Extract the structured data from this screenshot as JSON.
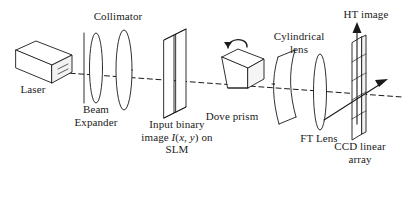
{
  "figure": {
    "background_color": "#ffffff",
    "line_color": "#1a1a1a",
    "width": 402,
    "height": 197
  },
  "labels": {
    "collimator": "Collimator",
    "laser": "Laser",
    "beam_expander_line1": "Beam",
    "beam_expander_line2": "Expander",
    "slm_line1": "Input binary",
    "slm_line2_pre": "image ",
    "slm_line2_i": "I",
    "slm_line2_paren_open": "(",
    "slm_line2_x": "x",
    "slm_line2_comma": ", ",
    "slm_line2_y": "y",
    "slm_line2_paren_close": ")",
    "slm_line2_post": " on",
    "slm_line3": "SLM",
    "dove_prism": "Dove prism",
    "cylindrical_line1": "Cylindrical",
    "cylindrical_line2": "lens",
    "ft_lens": "FT Lens",
    "ht_image": "HT image",
    "ccd_line1": "CCD linear",
    "ccd_line2": "array"
  },
  "components": [
    {
      "name": "laser",
      "kind": "3d-box",
      "label": "Laser"
    },
    {
      "name": "aperture",
      "kind": "vertical-line",
      "label": ""
    },
    {
      "name": "collimator-lens-1",
      "kind": "lens-ellipse",
      "label": "Collimator"
    },
    {
      "name": "collimator-lens-2",
      "kind": "lens-ellipse",
      "label": "Beam Expander"
    },
    {
      "name": "slm",
      "kind": "3d-plate",
      "label": "Input binary image I(x,y) on SLM"
    },
    {
      "name": "dove-prism",
      "kind": "3d-trapezoid-prism",
      "label": "Dove prism"
    },
    {
      "name": "rotation-arrow",
      "kind": "curved-arrow",
      "label": ""
    },
    {
      "name": "cylindrical-lens",
      "kind": "curved-3d-plate",
      "label": "Cylindrical lens"
    },
    {
      "name": "ft-lens",
      "kind": "lens-ellipse",
      "label": "FT Lens"
    },
    {
      "name": "ccd-linear-array",
      "kind": "segmented-plate",
      "label": "CCD linear array"
    },
    {
      "name": "optical-axis",
      "kind": "dashed-line",
      "label": ""
    },
    {
      "name": "ht-image-arrow",
      "kind": "up-arrow",
      "label": "HT image"
    },
    {
      "name": "ccd-axis-arrow",
      "kind": "diagonal-arrow",
      "label": ""
    }
  ]
}
